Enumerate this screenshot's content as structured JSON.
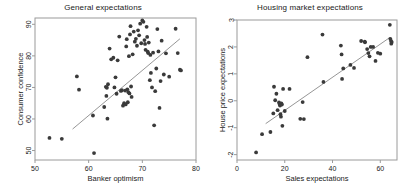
{
  "figure": {
    "background_color": "#ffffff",
    "point_color": "#3a3a3a",
    "line_color": "#8a8a8a",
    "frame_color": "#9a9a9a",
    "text_color": "#1a1a1a"
  },
  "chart_data": [
    {
      "type": "scatter",
      "panel": "left",
      "title": "General expectations",
      "xlabel": "Banker optimism",
      "ylabel": "Consumer confidence",
      "xlim": [
        50,
        80
      ],
      "ylim": [
        47,
        92
      ],
      "xticks": [
        50,
        60,
        70,
        80
      ],
      "yticks": [
        50,
        60,
        70,
        80,
        90
      ],
      "xtick_labels": [
        "50",
        "60",
        "70",
        "80"
      ],
      "ytick_labels": [
        "50",
        "60",
        "70",
        "80",
        "90"
      ],
      "grid": false,
      "legend": "none",
      "fit_line": {
        "x": [
          57.0,
          77.0
        ],
        "y": [
          56.8,
          85.4
        ]
      },
      "x": [
        52.7,
        55.0,
        57.8,
        58.2,
        60.8,
        61.0,
        62.9,
        63.2,
        63.3,
        63.4,
        63.5,
        63.6,
        63.9,
        64.2,
        64.6,
        64.8,
        65.0,
        65.2,
        65.4,
        65.7,
        66.0,
        66.2,
        66.4,
        66.6,
        66.8,
        66.9,
        67.0,
        67.1,
        67.2,
        67.3,
        67.4,
        67.5,
        67.6,
        67.7,
        67.8,
        67.9,
        68.0,
        68.2,
        68.4,
        68.6,
        68.8,
        69.0,
        69.2,
        69.4,
        69.6,
        69.8,
        70.0,
        70.2,
        70.4,
        70.5,
        70.6,
        70.8,
        70.9,
        71.0,
        71.1,
        71.2,
        71.4,
        71.5,
        71.6,
        71.8,
        72.0,
        72.2,
        72.4,
        72.6,
        72.8,
        73.0,
        73.2,
        73.4,
        73.6,
        74.0,
        74.4,
        75.0,
        76.2,
        76.6,
        77.0,
        77.2
      ],
      "y": [
        54.0,
        53.7,
        73.5,
        69.3,
        61.1,
        49.2,
        63.8,
        70.2,
        67.3,
        69.9,
        60.1,
        71.0,
        82.3,
        78.9,
        79.4,
        70.0,
        73.2,
        68.0,
        78.6,
        86.1,
        68.9,
        69.1,
        64.2,
        65.0,
        69.0,
        64.6,
        83.0,
        85.3,
        69.4,
        65.3,
        68.5,
        79.9,
        68.1,
        86.8,
        89.4,
        70.3,
        67.0,
        80.5,
        87.7,
        84.5,
        85.4,
        83.2,
        88.1,
        86.5,
        90.2,
        84.0,
        91.2,
        90.8,
        85.0,
        83.8,
        81.9,
        89.2,
        86.0,
        81.3,
        80.9,
        84.2,
        72.3,
        80.3,
        74.6,
        70.0,
        81.0,
        58.0,
        68.8,
        76.0,
        88.5,
        81.4,
        63.5,
        72.0,
        84.8,
        74.1,
        80.8,
        73.4,
        88.6,
        80.9,
        75.6,
        75.4
      ]
    },
    {
      "type": "scatter",
      "panel": "right",
      "title": "Housing market expectations",
      "xlabel": "Sales expectations",
      "ylabel": "House price expectations",
      "xlim": [
        0,
        67
      ],
      "ylim": [
        -2.2,
        3.0
      ],
      "xticks": [
        0,
        20,
        40,
        60
      ],
      "yticks": [
        -2,
        -1,
        0,
        1,
        2,
        3
      ],
      "xtick_labels": [
        "0",
        "20",
        "40",
        "60"
      ],
      "ytick_labels": [
        "-2",
        "-1",
        "0",
        "1",
        "2",
        "3"
      ],
      "grid": false,
      "legend": "none",
      "fit_line": {
        "x": [
          12.0,
          64.0
        ],
        "y": [
          -0.85,
          2.35
        ]
      },
      "x": [
        8.0,
        10.5,
        14.0,
        15.2,
        15.5,
        16.0,
        16.5,
        17.0,
        17.6,
        17.8,
        18.0,
        18.2,
        18.4,
        18.6,
        18.8,
        19.0,
        19.3,
        20.0,
        22.0,
        26.5,
        27.5,
        28.0,
        29.5,
        35.8,
        36.2,
        43.5,
        43.8,
        44.0,
        44.5,
        47.5,
        49.0,
        52.0,
        53.5,
        53.6,
        54.5,
        55.0,
        55.5,
        56.0,
        57.0,
        58.0,
        59.0,
        60.0,
        64.0,
        64.2,
        64.5,
        64.6,
        64.8
      ],
      "y": [
        -1.92,
        -1.24,
        -1.16,
        -0.47,
        0.52,
        0.02,
        0.26,
        -0.35,
        -0.06,
        -0.12,
        -0.18,
        -0.5,
        -0.59,
        -0.1,
        -0.14,
        -0.93,
        0.44,
        -0.38,
        0.44,
        -0.67,
        -0.05,
        -0.68,
        1.62,
        2.46,
        0.7,
        2.05,
        1.72,
        0.81,
        1.2,
        1.33,
        1.22,
        2.22,
        2.2,
        2.17,
        1.92,
        1.77,
        1.65,
        2.0,
        2.0,
        1.48,
        1.78,
        1.75,
        2.82,
        2.3,
        2.22,
        2.12,
        2.18
      ]
    }
  ]
}
